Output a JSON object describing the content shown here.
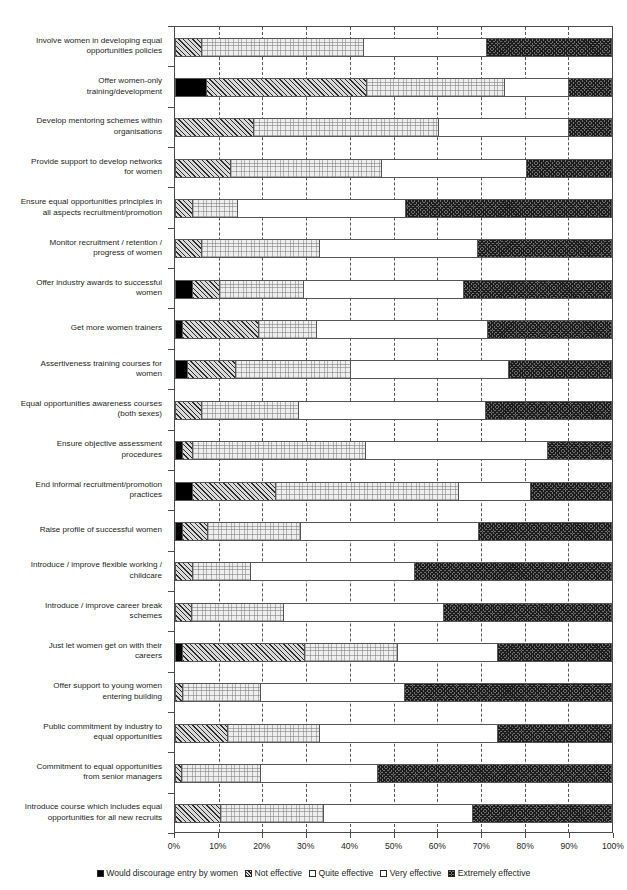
{
  "chart_data": {
    "type": "bar",
    "orientation": "horizontal",
    "stacked": true,
    "normalized_percent": true,
    "title": "",
    "xlabel": "",
    "ylabel": "",
    "xlim": [
      0,
      100
    ],
    "grid": true,
    "legend_position": "bottom",
    "xtick_labels": [
      "0%",
      "10%",
      "20%",
      "30%",
      "40%",
      "50%",
      "60%",
      "70%",
      "80%",
      "90%",
      "100%"
    ],
    "xtick_values": [
      0,
      10,
      20,
      30,
      40,
      50,
      60,
      70,
      80,
      90,
      100
    ],
    "legend": [
      "Would discourage entry by women",
      "Not effective",
      "Quite effective",
      "Very effective",
      "Extremely effective"
    ],
    "series": [
      {
        "name": "Would discourage entry by women",
        "values": [
          0,
          7,
          0,
          0,
          0,
          0,
          3.6,
          1.4,
          2.5,
          0,
          1.4,
          3.6,
          1.4,
          0,
          0,
          1.5,
          0,
          0,
          0,
          0
        ]
      },
      {
        "name": "Not effective",
        "values": [
          5.7,
          36.8,
          17.8,
          12.5,
          3.6,
          5.9,
          6.2,
          17.5,
          11,
          5.7,
          2.2,
          19.1,
          5.6,
          3.6,
          3.4,
          28,
          1.5,
          11.7,
          1.1,
          10.1
        ]
      },
      {
        "name": "Quite effective",
        "values": [
          37.3,
          31.8,
          42.7,
          34.7,
          10.2,
          27,
          19.3,
          13.2,
          26.4,
          22.3,
          39.9,
          42.2,
          21.3,
          13.4,
          21.2,
          21.3,
          17.6,
          21.2,
          18.2,
          23.8
        ]
      },
      {
        "name": "Very effective",
        "values": [
          28.4,
          14.7,
          29.8,
          33.3,
          38.7,
          36.3,
          36.8,
          39.3,
          36.4,
          43,
          41.9,
          16.6,
          41.1,
          37.6,
          36.8,
          22.9,
          33.1,
          41,
          26.8,
          34.1
        ]
      },
      {
        "name": "Extremely effective",
        "values": [
          28.6,
          9.7,
          9.7,
          19.5,
          47.5,
          30.8,
          34.1,
          28.6,
          23.7,
          29,
          14.6,
          18.5,
          30.6,
          45.4,
          38.6,
          26.3,
          47.8,
          26.1,
          53.9,
          32
        ]
      }
    ],
    "categories": [
      "Involve women in developing equal opportunities policies",
      "Offer women-only training/development",
      "Develop mentoring schemes within organisations",
      "Provide support to develop networks for women",
      "Ensure equal opportunities principles in all aspects recruitment/promotion",
      "Monitor recruitment / retention / progress of women",
      "Offer industry awards to successful women",
      "Get more women trainers",
      "Assertiveness training courses for women",
      "Equal opportunities awareness courses (both sexes)",
      "Ensure objective assessment procedures",
      "End informal recruitment/promotion practices",
      "Raise profile of successful women",
      "Introduce / improve flexible working / childcare",
      "Introduce / improve career break schemes",
      "Just let women get on with their careers",
      "Offer support to young women entering building",
      "Public commitment by industry to equal opportunities",
      "Commitment to equal opportunities from senior managers",
      "Introduce course which includes equal opportunities for all new recruits"
    ],
    "category_lines": [
      [
        "Involve women in developing equal",
        "opportunities policies"
      ],
      [
        "Offer women-only",
        "training/development"
      ],
      [
        "Develop mentoring schemes within",
        "organisations"
      ],
      [
        "Provide support to develop networks",
        "for women"
      ],
      [
        "Ensure equal opportunities principles in",
        "all aspects recruitment/promotion"
      ],
      [
        "Monitor recruitment / retention /",
        "progress of women"
      ],
      [
        "Offer industry awards to successful",
        "women"
      ],
      [
        "Get more women trainers"
      ],
      [
        "Assertiveness training courses for",
        "women"
      ],
      [
        "Equal opportunities awareness courses",
        "(both sexes)"
      ],
      [
        "Ensure objective assessment",
        "procedures"
      ],
      [
        "End informal recruitment/promotion",
        "practices"
      ],
      [
        "Raise profile of successful women"
      ],
      [
        "Introduce / improve flexible working /",
        "childcare"
      ],
      [
        "Introduce / improve career break",
        "schemes"
      ],
      [
        "Just let women get on with their",
        "careers"
      ],
      [
        "Offer support to young women",
        "entering building"
      ],
      [
        "Public commitment by industry to",
        "equal opportunities"
      ],
      [
        "Commitment to equal opportunities",
        "from senior managers"
      ],
      [
        "Introduce course which includes equal",
        "opportunities for all new recruits"
      ]
    ]
  },
  "colors": {
    "discourage": "#000000",
    "not_effective": "#d9d9d9",
    "quite_effective": "#eeeeee",
    "very_effective": "#ffffff",
    "extremely_effective": "#6f6f6f",
    "axis": "#4a4a4a"
  }
}
